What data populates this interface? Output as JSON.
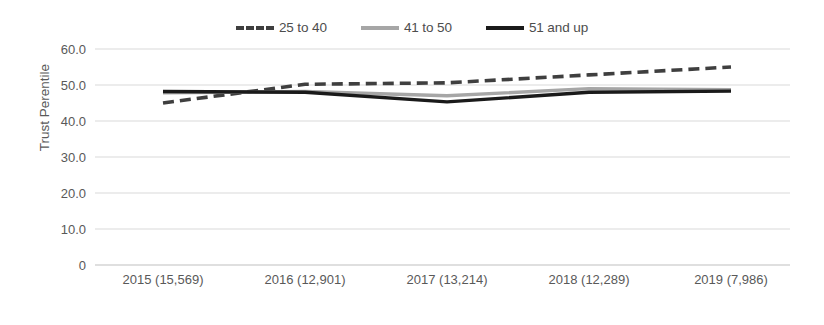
{
  "chart_data": {
    "type": "line",
    "title": "",
    "xlabel": "",
    "ylabel": "Trust Perentile",
    "categories": [
      "2015 (15,569)",
      "2016 (12,901)",
      "2017 (13,214)",
      "2018 (12,289)",
      "2019 (7,986)"
    ],
    "ylim": [
      0,
      60
    ],
    "yticks": [
      "0",
      "10.0",
      "20.0",
      "30.0",
      "40.0",
      "50.0",
      "60.0"
    ],
    "ytick_values": [
      0,
      10,
      20,
      30,
      40,
      50,
      60
    ],
    "grid": true,
    "legend_position": "top-center",
    "series": [
      {
        "name": "25 to 40",
        "style": "dashed",
        "color": "#3f3f3f",
        "values": [
          45.0,
          50.2,
          50.6,
          52.8,
          55.0
        ]
      },
      {
        "name": "41 to 50",
        "style": "solid",
        "color": "#a6a6a6",
        "values": [
          47.8,
          48.2,
          47.0,
          49.0,
          48.7
        ]
      },
      {
        "name": "51 and up",
        "style": "solid",
        "color": "#1a1a1a",
        "values": [
          48.2,
          48.0,
          45.3,
          48.0,
          48.3
        ]
      }
    ]
  },
  "legend": {
    "items": [
      {
        "label": "25 to 40"
      },
      {
        "label": "41 to 50"
      },
      {
        "label": "51 and up"
      }
    ]
  },
  "axes": {
    "y_title": "Trust Perentile"
  }
}
